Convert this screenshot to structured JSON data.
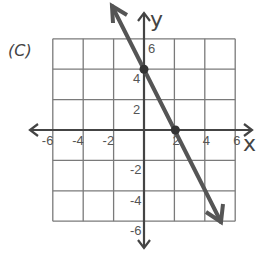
{
  "panel_label": "(C)",
  "axes": {
    "x_name": "x",
    "y_name": "y"
  },
  "x_ticks": [
    {
      "value": -6,
      "label": "-6"
    },
    {
      "value": -4,
      "label": "-4"
    },
    {
      "value": -2,
      "label": "-2"
    },
    {
      "value": 2,
      "label": "2"
    },
    {
      "value": 4,
      "label": "4"
    },
    {
      "value": 6,
      "label": "6"
    }
  ],
  "y_ticks": [
    {
      "value": 6,
      "label": "6"
    },
    {
      "value": 4,
      "label": "4"
    },
    {
      "value": 2,
      "label": "2"
    },
    {
      "value": -2,
      "label": "-2"
    },
    {
      "value": -4,
      "label": "-4"
    },
    {
      "value": -6,
      "label": "-6"
    }
  ],
  "colors": {
    "grid": "#7a7a7a",
    "axis": "#444444",
    "line": "#555555",
    "text": "#555555"
  },
  "chart_data": {
    "type": "line",
    "title": "(C)",
    "xlabel": "x",
    "ylabel": "y",
    "xlim": [
      -6,
      6
    ],
    "ylim": [
      -6,
      6
    ],
    "grid": true,
    "grid_step": 2,
    "equation": "y = -2x + 4",
    "series": [
      {
        "name": "line",
        "x": [
          -0.5,
          0,
          2,
          5
        ],
        "y": [
          5,
          4,
          0,
          -6
        ],
        "arrows_both_ends": true
      }
    ],
    "marked_points": [
      {
        "x": 0,
        "y": 4
      },
      {
        "x": 2,
        "y": 0
      }
    ],
    "x_tick_labels": [
      "-6",
      "-4",
      "-2",
      "2",
      "4",
      "6"
    ],
    "y_tick_labels": [
      "6",
      "4",
      "2",
      "-2",
      "-4",
      "-6"
    ]
  }
}
